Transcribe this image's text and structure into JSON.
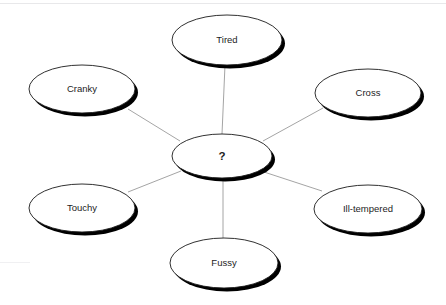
{
  "diagram": {
    "type": "word-web",
    "title": "",
    "background_color": "#ffffff",
    "node_fill": "#ffffff",
    "node_stroke": "#1a1a1a",
    "shadow_color": "#000000",
    "connector_color": "#9a9a9a",
    "center": {
      "id": "center",
      "label": "?",
      "cx": 222,
      "cy": 156,
      "rx": 50,
      "ry": 22
    },
    "nodes": [
      {
        "id": "tired",
        "label": "Tired",
        "cx": 227,
        "cy": 40,
        "rx": 55,
        "ry": 25
      },
      {
        "id": "cranky",
        "label": "Cranky",
        "cx": 82,
        "cy": 89,
        "rx": 53,
        "ry": 24
      },
      {
        "id": "cross",
        "label": "Cross",
        "cx": 368,
        "cy": 93,
        "rx": 53,
        "ry": 24
      },
      {
        "id": "touchy",
        "label": "Touchy",
        "cx": 82,
        "cy": 208,
        "rx": 53,
        "ry": 24
      },
      {
        "id": "ill-tempered",
        "label": "Ill-tempered",
        "cx": 368,
        "cy": 209,
        "rx": 54,
        "ry": 24
      },
      {
        "id": "fussy",
        "label": "Fussy",
        "cx": 224,
        "cy": 263,
        "rx": 54,
        "ry": 25
      }
    ],
    "connectors": [
      {
        "from": "center",
        "to": "tired",
        "x1": 222,
        "y1": 134,
        "x2": 225,
        "y2": 65
      },
      {
        "from": "center",
        "to": "cranky",
        "x1": 180,
        "y1": 141,
        "x2": 128,
        "y2": 109
      },
      {
        "from": "center",
        "to": "cross",
        "x1": 263,
        "y1": 141,
        "x2": 323,
        "y2": 108
      },
      {
        "from": "center",
        "to": "touchy",
        "x1": 181,
        "y1": 171,
        "x2": 128,
        "y2": 192
      },
      {
        "from": "center",
        "to": "ill-tempered",
        "x1": 264,
        "y1": 172,
        "x2": 322,
        "y2": 191
      },
      {
        "from": "center",
        "to": "fussy",
        "x1": 223,
        "y1": 178,
        "x2": 223,
        "y2": 240
      }
    ]
  }
}
